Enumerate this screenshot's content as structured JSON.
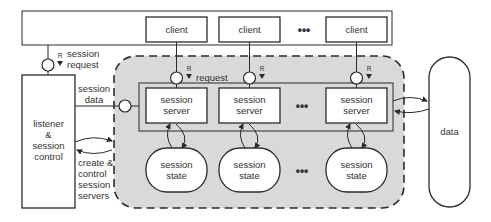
{
  "diagram": {
    "colors": {
      "background": "#ffffff",
      "stroke": "#2b2b2b",
      "shaded_region": "#d9d9d9",
      "text": "#333333"
    },
    "clients": [
      {
        "label": "client"
      },
      {
        "label": "client"
      },
      {
        "label": "client"
      }
    ],
    "clients_ellipsis": "•••",
    "session_request": {
      "role_marker": "R",
      "label_line1": "session",
      "label_line2": "request"
    },
    "listener": {
      "line1": "listener",
      "line2": "&",
      "line3": "session",
      "line4": "control"
    },
    "session_data": {
      "line1": "session",
      "line2": "data"
    },
    "create_control": {
      "line1": "create &",
      "line2": "control",
      "line3": "session",
      "line4": "servers"
    },
    "request_port": {
      "role_marker": "R",
      "label": "request"
    },
    "servers": [
      {
        "line1": "session",
        "line2": "server"
      },
      {
        "line1": "session",
        "line2": "server"
      },
      {
        "line1": "session",
        "line2": "server"
      }
    ],
    "servers_ellipsis": "•••",
    "states": [
      {
        "line1": "session",
        "line2": "state"
      },
      {
        "line1": "session",
        "line2": "state"
      },
      {
        "line1": "session",
        "line2": "state"
      }
    ],
    "states_ellipsis": "•••",
    "data_store": {
      "label": "data"
    }
  }
}
